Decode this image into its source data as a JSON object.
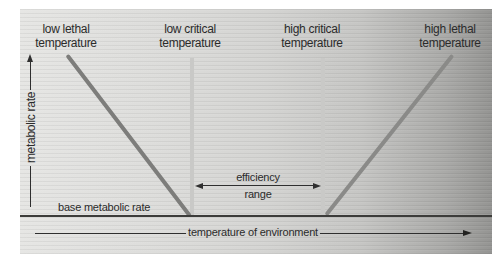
{
  "figure": {
    "labels": {
      "low_lethal": "low lethal\ntemperature",
      "low_critical": "low critical\ntemperature",
      "high_critical": "high critical\ntemperature",
      "high_lethal": "high lethal\ntemperature"
    },
    "y_axis": {
      "label": "metabolic rate"
    },
    "x_axis": {
      "label": "temperature of environment"
    },
    "base_line": {
      "label": "base metabolic rate"
    },
    "efficiency": {
      "line1": "efficiency",
      "line2": "range"
    },
    "colors": {
      "panel_gradient_left": "#e6e6e4",
      "panel_gradient_right": "#949492",
      "critical_temperature_line": "#c9c9c7",
      "lethal_line_left": "#7d7d7b",
      "lethal_line_right": "#8a8a88",
      "base_metabolic_line": "#3c3c3a",
      "axis_line": "#2f2f2f",
      "text": "#2b2b2b"
    },
    "geometry_note": "two vertical critical-temperature lines bound the efficiency range; metabolic rate rises diagonally toward each lethal temperature outside that range"
  }
}
